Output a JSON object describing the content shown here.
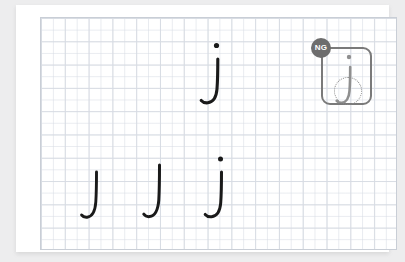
{
  "app": {
    "title": "Handwriting Practice Worksheet",
    "background_color": "#ededee",
    "paper_color": "#ffffff"
  },
  "canvas": {
    "name": "writing-grid",
    "grid_color": "#d9dde3",
    "border_color": "#c9ced6",
    "columns": 15,
    "rows": 10,
    "cell_width_px": 23.8,
    "cell_height_px": 23.3
  },
  "ink": {
    "color": "#1a1a1a",
    "faded_color": "#8f8f8f"
  },
  "strokes": [
    {
      "id": "stroke-1",
      "character": "J",
      "label": "incomplete-j-hook",
      "has_dot": false,
      "state": "practice",
      "x": 66,
      "y": 168,
      "height": 48,
      "color": "#1a1a1a"
    },
    {
      "id": "stroke-2",
      "character": "J",
      "label": "incomplete-j-hook",
      "has_dot": false,
      "state": "practice",
      "x": 128,
      "y": 160,
      "height": 56,
      "color": "#1a1a1a"
    },
    {
      "id": "stroke-3",
      "character": "j",
      "label": "complete-j-with-dot",
      "has_dot": true,
      "state": "practice",
      "x": 190,
      "y": 154,
      "height": 62,
      "color": "#1a1a1a"
    },
    {
      "id": "stroke-4",
      "character": "j",
      "label": "complete-j-with-dot",
      "has_dot": true,
      "state": "model",
      "x": 196,
      "y": 40,
      "height": 62,
      "color": "#1a1a1a"
    }
  ],
  "annotation": {
    "badge_label": "NG",
    "badge_color": "#6d6d6d",
    "badge_text_color": "#ffffff",
    "box_color": "#7a7a7a",
    "error_marker": "dotted-circle",
    "error_marker_color": "#8a8a8a",
    "reviewed_character": "j",
    "reviewed_character_color": "#8f8f8f"
  }
}
